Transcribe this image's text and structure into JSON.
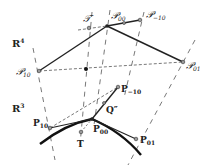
{
  "figure": {
    "width": 211,
    "height": 165,
    "colors": {
      "ink": "#222222",
      "dash": "#555555",
      "point_fill": "#888888",
      "background": "#ffffff"
    },
    "spaces": [
      {
        "id": "R4",
        "label": "R",
        "sup": "4",
        "x": 12,
        "y": 47
      },
      {
        "id": "R3",
        "label": "R",
        "sup": "3",
        "x": 12,
        "y": 112
      }
    ],
    "upper_points": [
      {
        "id": "P00u",
        "label": "𝒫",
        "sub": "00",
        "x": 107,
        "y": 26,
        "lx": 111,
        "ly": 19
      },
      {
        "id": "Pm10u",
        "label": "𝒫",
        "sub": "−10",
        "x": 140,
        "y": 20,
        "lx": 146,
        "ly": 18
      },
      {
        "id": "Tu",
        "label": "𝒯",
        "sub": "",
        "x": 89,
        "y": 28,
        "lx": 83,
        "ly": 22
      },
      {
        "id": "P10u",
        "label": "𝒫",
        "sub": "10",
        "x": 39,
        "y": 71,
        "lx": 16,
        "ly": 75
      },
      {
        "id": "P01u",
        "label": "𝒫",
        "sub": "01",
        "x": 183,
        "y": 62,
        "lx": 186,
        "ly": 69
      },
      {
        "id": "midu",
        "label": "",
        "sub": "",
        "x": 86,
        "y": 69
      }
    ],
    "lower_points": [
      {
        "id": "Pm10",
        "label": "P",
        "sub": "−10",
        "x": 118,
        "y": 87,
        "lx": 121,
        "ly": 92
      },
      {
        "id": "Qpp",
        "label": "Q″",
        "sub": "",
        "x": 104,
        "y": 103,
        "lx": 106,
        "ly": 113
      },
      {
        "id": "P10",
        "label": "P",
        "sub": "10",
        "x": 50,
        "y": 128,
        "lx": 33,
        "ly": 126
      },
      {
        "id": "P00",
        "label": "P",
        "sub": "00",
        "x": 92,
        "y": 119,
        "lx": 93,
        "ly": 132
      },
      {
        "id": "T",
        "label": "T",
        "sub": "",
        "x": 81,
        "y": 132,
        "lx": 77,
        "ly": 147
      },
      {
        "id": "P01",
        "label": "P",
        "sub": "01",
        "x": 136,
        "y": 139,
        "lx": 140,
        "ly": 143
      }
    ]
  }
}
